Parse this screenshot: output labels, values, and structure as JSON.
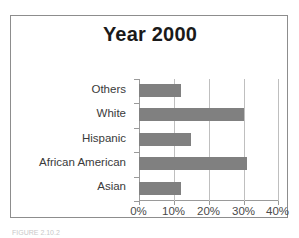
{
  "figure": {
    "caption": "FIGURE 2.10.2"
  },
  "chart_data": {
    "type": "bar",
    "orientation": "horizontal",
    "title": "Year 2000",
    "xlabel": "",
    "ylabel": "",
    "categories": [
      "Asian",
      "African American",
      "Hispanic",
      "White",
      "Others"
    ],
    "values": [
      12,
      31,
      15,
      30,
      12
    ],
    "display_order_top_to_bottom": [
      "Others",
      "White",
      "Hispanic",
      "African American",
      "Asian"
    ],
    "xlim": [
      0,
      40
    ],
    "xticks": [
      0,
      10,
      20,
      30,
      40
    ],
    "xtick_labels": [
      "0%",
      "10%",
      "20%",
      "30%",
      "40%"
    ],
    "grid": "vertical",
    "legend": "none",
    "bar_color": "#808080",
    "gridline_color": "#bfbfbf",
    "axis_color": "#9a9a9a",
    "title_color": "#1a1a1a"
  }
}
